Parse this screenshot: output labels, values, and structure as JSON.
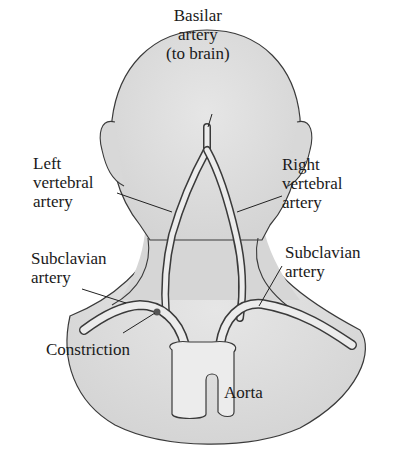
{
  "diagram": {
    "colors": {
      "skin_fill": "#dcdcdc",
      "outline": "#3a3a3a",
      "artery_fill": "#ececec",
      "text": "#1a1a1a"
    },
    "labels": {
      "basilar": [
        "Basilar",
        "artery",
        "(to brain)"
      ],
      "left_vertebral": [
        "Left",
        "vertebral",
        "artery"
      ],
      "right_vertebral": [
        "Right",
        "vertebral",
        "artery"
      ],
      "left_subclavian": [
        "Subclavian",
        "artery"
      ],
      "right_subclavian": [
        "Subclavian",
        "artery"
      ],
      "constriction": "Constriction",
      "aorta": "Aorta"
    }
  }
}
